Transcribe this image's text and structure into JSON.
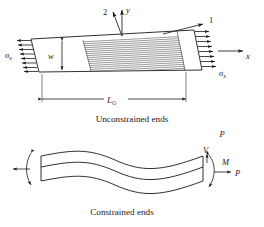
{
  "figure": {
    "stroke_color": "#1a1a1a",
    "hatch_color": "#555555",
    "background": "#ffffff"
  },
  "upper": {
    "caption": "Unconstrained ends",
    "stress_left": "σ",
    "stress_left_sub": "x",
    "stress_right": "σ",
    "stress_right_sub": "x",
    "width_label": "w",
    "gauge_label": "L",
    "gauge_sub": "G",
    "axis_y": "y",
    "axis_x": "x",
    "material_axis_1": "1",
    "material_axis_2": "2",
    "arrow_count_left": 8,
    "arrow_count_right": 8,
    "hatch_line_count": 17
  },
  "lower": {
    "caption": "Constrained ends",
    "load_label_top": "P",
    "shear_label": "V",
    "moment_label": "M",
    "axial_label": "P"
  }
}
